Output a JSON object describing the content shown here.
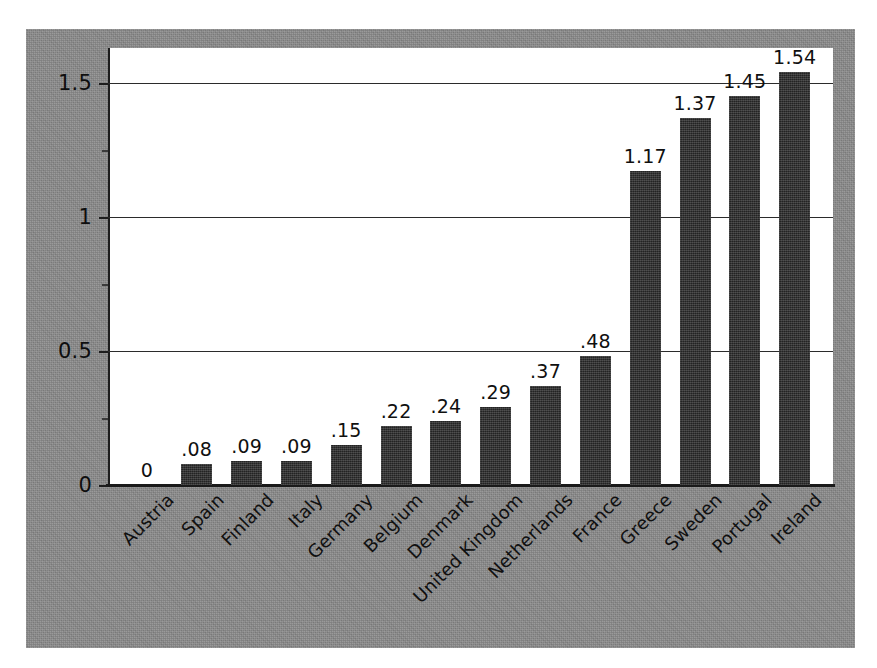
{
  "chart_data": {
    "type": "bar",
    "title": "",
    "xlabel": "",
    "ylabel": "",
    "categories": [
      "Austria",
      "Spain",
      "Finland",
      "Italy",
      "Germany",
      "Belgium",
      "Denmark",
      "United Kingdom",
      "Netherlands",
      "France",
      "Greece",
      "Sweden",
      "Portugal",
      "Ireland"
    ],
    "values": [
      0,
      0.08,
      0.09,
      0.09,
      0.15,
      0.22,
      0.24,
      0.29,
      0.37,
      0.48,
      1.17,
      1.37,
      1.45,
      1.54
    ],
    "value_labels": [
      "0",
      ".08",
      ".09",
      ".09",
      ".15",
      ".22",
      ".24",
      ".29",
      ".37",
      ".48",
      "1.17",
      "1.37",
      "1.45",
      "1.54"
    ],
    "ytick_labels": [
      "0",
      "0.5",
      "1",
      "1.5"
    ],
    "ytick_values": [
      0,
      0.5,
      1,
      1.5
    ],
    "ylim": [
      0,
      1.62
    ],
    "grid": true,
    "legend": "none",
    "bar_color": "#2c2c2c",
    "panel_color": "#8a8a8a",
    "plot_bg": "#ffffff",
    "axis_color": "#1d1d1d",
    "label_rotation_deg": -45
  }
}
